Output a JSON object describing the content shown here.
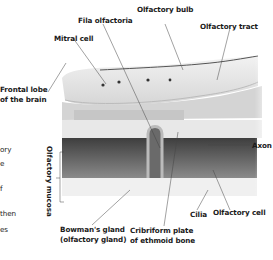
{
  "diagram": {
    "labels": {
      "fila_olfactoria": "Fila olfactoria",
      "olfactory_bulb": "Olfactory bulb",
      "olfactory_tract": "Olfactory tract",
      "mitral_cell": "Mitral cell",
      "frontal_lobe_1": "Frontal lobe",
      "frontal_lobe_2": "of the brain",
      "axon": "Axon",
      "olfactory_mucosa": "Olfactory mucosa",
      "bowmans_gland_1": "Bowman's gland",
      "bowmans_gland_2": "(olfactory gland)",
      "cribriform_1": "Cribriform plate",
      "cribriform_2": "of ethmoid bone",
      "cilia": "Cilia",
      "olfactory_cell": "Olfactory cell"
    },
    "cut_text_left": [
      "ory",
      "e",
      "f",
      "then",
      "es"
    ],
    "colors": {
      "brain": "#e4e4e4",
      "bone": "#cfcfcf",
      "mucosa": "#5a5a5a",
      "leader": "#444444"
    }
  }
}
